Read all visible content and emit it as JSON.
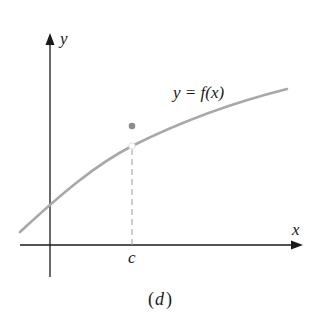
{
  "figure": {
    "caption": "(d)",
    "caption_open": "(",
    "caption_letter": "d",
    "caption_close": ")",
    "axis_x_label": "x",
    "axis_y_label": "y",
    "point_label": "c",
    "curve_label": "y = f(x)",
    "colors": {
      "axes": "#1a1a1a",
      "curve": "#a8a8a8",
      "dot": "#8c8c8c",
      "dashed": "#9a9a9a"
    }
  }
}
